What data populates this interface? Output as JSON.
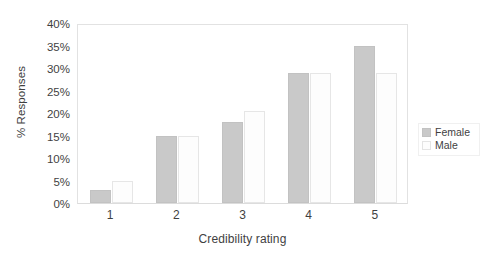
{
  "chart_data": {
    "type": "bar",
    "title": "",
    "xlabel": "Credibility rating",
    "ylabel": "% Responses",
    "categories": [
      "1",
      "2",
      "3",
      "4",
      "5"
    ],
    "series": [
      {
        "name": "Female",
        "color": "#c9c9c9",
        "values": [
          3,
          15,
          18,
          29,
          35
        ]
      },
      {
        "name": "Male",
        "color": "#fdfdfd",
        "values": [
          5,
          15,
          20.5,
          29,
          29
        ]
      }
    ],
    "ylim": [
      0,
      40
    ],
    "ytick_values": [
      0,
      5,
      10,
      15,
      20,
      25,
      30,
      35,
      40
    ],
    "ytick_labels": [
      "0%",
      "5%",
      "10%",
      "15%",
      "20%",
      "25%",
      "30%",
      "35%",
      "40%"
    ],
    "grid": false,
    "legend_position": "right"
  },
  "legend": {
    "entries": [
      {
        "label": "Female",
        "swatch": "female-swatch"
      },
      {
        "label": "Male",
        "swatch": "male-swatch"
      }
    ]
  }
}
